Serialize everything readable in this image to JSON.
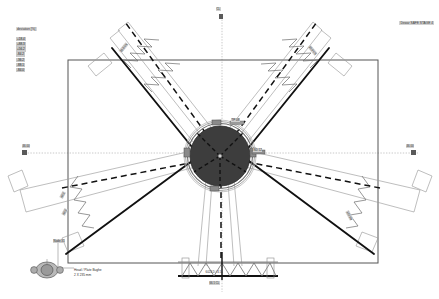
{
  "drawing": {
    "type": "cad-plan-view",
    "title_block": {
      "text": "Dewar SAFE STAGE 4"
    },
    "legend": {
      "title": "deviation [%]",
      "rows": [
        "+18.4",
        "+88.3",
        "+56.2",
        "-84.2",
        "-36.2",
        "-88.1",
        "-84.0"
      ]
    },
    "centerline_labels": {
      "left": "46.00",
      "right": "46.00",
      "top": "CL",
      "bottom": "66.5 CL"
    },
    "annotations": {
      "arm_upper_left": "35.0 kN",
      "arm_upper_right": "35.0 kN",
      "arm_lower_left_1": "48.2",
      "arm_lower_left_2": "48.2",
      "arm_lower_left_3": "Node 31",
      "arm_lower_right": "122 kN",
      "hub_right": "ND 12",
      "hub_top": "TP 08",
      "truss_label": "6024 D / 4.5"
    },
    "detail": {
      "caption_line1": "Head / Plate Bughe",
      "caption_line2": "2 X 235 mm"
    },
    "colors": {
      "hub_fill": "#3a3a3a",
      "frame_line": "#555555",
      "beam_line": "#8c8c8c",
      "heavy_line": "#111111",
      "dashed_line": "#111111",
      "centerline": "#9a9a9a",
      "background": "#ffffff"
    },
    "geometry": {
      "frame": {
        "x": 68,
        "y": 60,
        "width": 310,
        "height": 203
      },
      "hub": {
        "cx": 220,
        "cy": 156,
        "r": 33
      },
      "centerline_y": 153,
      "centerline_x": 222
    }
  }
}
